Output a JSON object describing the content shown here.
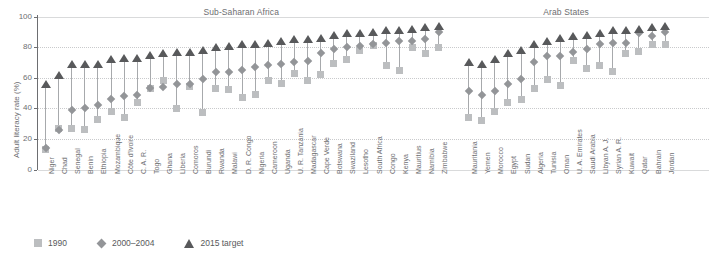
{
  "chart_data": {
    "type": "scatter",
    "title": "",
    "xlabel": "",
    "ylabel": "Adult literacy rate (%)",
    "ylim": [
      0,
      100
    ],
    "yticks": [
      0,
      20,
      40,
      60,
      80,
      100
    ],
    "grid": true,
    "legend_position": "bottom-left",
    "series": [
      {
        "name": "1990",
        "marker": "square",
        "color": "#bcbec0"
      },
      {
        "name": "2000–2004",
        "marker": "diamond",
        "color": "#939598"
      },
      {
        "name": "2015 target",
        "marker": "triangle",
        "color": "#58595b"
      }
    ],
    "groups": [
      {
        "name": "Sub-Saharan Africa",
        "start_index": 0,
        "end_index": 33
      },
      {
        "name": "Arab States",
        "start_index": 34,
        "end_index": 50
      }
    ],
    "categories": [
      "Niger",
      "Chad",
      "Senegal",
      "Benin",
      "Ethiopia",
      "Mozambique",
      "Côte d'Ivoire",
      "C. A. R.",
      "Togo",
      "Ghana",
      "Liberia",
      "Comoros",
      "Burundi",
      "Rwanda",
      "Malawi",
      "D. R. Congo",
      "Nigeria",
      "Cameroon",
      "Uganda",
      "U. R. Tanzania",
      "Madagascar",
      "Cape Verde",
      "Botswana",
      "Swaziland",
      "Lesotho",
      "South Africa",
      "Congo",
      "Kenya",
      "Mauritius",
      "Namibia",
      "Zimbabwe",
      "Mauritania",
      "Yemen",
      "Morocco",
      "Egypt",
      "Sudan",
      "Algeria",
      "Tunisia",
      "Oman",
      "U. A. Emirates",
      "Saudi Arabia",
      "Libyan A. J.",
      "Syrian A. R.",
      "Kuwait",
      "Qatar",
      "Bahrain",
      "Jordan"
    ],
    "values_1990": [
      13,
      27,
      27,
      26,
      33,
      38,
      34,
      44,
      53,
      58,
      40,
      54,
      37,
      53,
      52,
      47,
      49,
      58,
      56,
      63,
      58,
      62,
      69,
      72,
      78,
      81,
      68,
      65,
      80,
      76,
      80,
      34,
      32,
      38,
      44,
      46,
      53,
      59,
      55,
      71,
      66,
      68,
      64,
      76,
      77,
      82,
      82
    ],
    "values_2000_2004": [
      14,
      26,
      39,
      40,
      42,
      46,
      48,
      49,
      53,
      54,
      56,
      56,
      59,
      64,
      64,
      65,
      67,
      68,
      69,
      70,
      71,
      76,
      79,
      80,
      81,
      82,
      83,
      84,
      84,
      85,
      90,
      51,
      49,
      51,
      56,
      59,
      70,
      74,
      74,
      77,
      79,
      82,
      83,
      83,
      89,
      87,
      90
    ],
    "values_2015_target": [
      56,
      62,
      69,
      69,
      69,
      72,
      73,
      73,
      75,
      76,
      77,
      77,
      78,
      80,
      81,
      82,
      82,
      83,
      84,
      85,
      85,
      86,
      88,
      89,
      89,
      90,
      91,
      91,
      92,
      93,
      94,
      70,
      69,
      72,
      76,
      78,
      82,
      84,
      86,
      87,
      88,
      89,
      91,
      91,
      92,
      93,
      94
    ]
  },
  "legend": {
    "items": [
      {
        "label": "1990"
      },
      {
        "label": "2000–2004"
      },
      {
        "label": "2015 target"
      }
    ]
  },
  "axis": {
    "y_title": "Adult literacy rate (%)",
    "y_tick_labels": [
      "100",
      "80",
      "60",
      "40",
      "20",
      "0"
    ]
  },
  "group_titles": {
    "left": "Sub-Saharan Africa",
    "right": "Arab States"
  }
}
